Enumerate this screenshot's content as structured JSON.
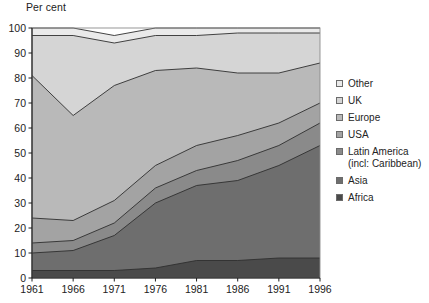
{
  "chart_data": {
    "type": "area",
    "stacked": true,
    "title": "",
    "subtitle": "",
    "ylabel": "Per cent",
    "xlabel": "",
    "ylim": [
      0,
      100
    ],
    "yticks": [
      0,
      10,
      20,
      30,
      40,
      50,
      60,
      70,
      80,
      90,
      100
    ],
    "grid": false,
    "legend_position": "right",
    "x": [
      1961,
      1966,
      1971,
      1976,
      1981,
      1986,
      1991,
      1996
    ],
    "categories": [
      "1961",
      "1966",
      "1971",
      "1976",
      "1981",
      "1986",
      "1991",
      "1996"
    ],
    "series": [
      {
        "name": "Africa",
        "color": "#4a4a4a",
        "values": [
          3,
          3,
          3,
          4,
          7,
          7,
          8,
          8
        ]
      },
      {
        "name": "Asia",
        "color": "#6e6e6e",
        "values": [
          7,
          8,
          14,
          26,
          30,
          32,
          37,
          45
        ]
      },
      {
        "name": "Latin America (incl: Caribbean)",
        "color": "#8a8a8a",
        "values": [
          4,
          4,
          5,
          6,
          6,
          8,
          8,
          9
        ]
      },
      {
        "name": "USA",
        "color": "#a3a3a3",
        "values": [
          10,
          8,
          9,
          9,
          10,
          10,
          9,
          8
        ]
      },
      {
        "name": "Europe",
        "color": "#b9b9b9",
        "values": [
          57,
          42,
          46,
          38,
          31,
          25,
          20,
          16
        ]
      },
      {
        "name": "UK",
        "color": "#d5d5d5",
        "values": [
          16,
          32,
          17,
          14,
          13,
          16,
          16,
          12
        ]
      },
      {
        "name": "Other",
        "color": "#eaeaea",
        "values": [
          3,
          3,
          3,
          3,
          3,
          2,
          2,
          2
        ]
      }
    ],
    "cumulative_top_boundaries": {
      "Africa": [
        3,
        3,
        3,
        4,
        7,
        7,
        8,
        8
      ],
      "Asia": [
        10,
        11,
        17,
        30,
        37,
        39,
        45,
        53
      ],
      "LatinAmerica": [
        14,
        15,
        22,
        36,
        43,
        47,
        53,
        62
      ],
      "USA": [
        24,
        23,
        31,
        45,
        53,
        57,
        62,
        70
      ],
      "Europe": [
        81,
        65,
        77,
        83,
        84,
        82,
        82,
        86
      ],
      "UK": [
        97,
        97,
        94,
        97,
        97,
        98,
        98,
        98
      ],
      "Other": [
        100,
        100,
        100,
        100,
        100,
        100,
        100,
        100
      ]
    }
  },
  "axis": {
    "y_title": "Per cent",
    "y_tick_labels": [
      "100",
      "90",
      "80",
      "70",
      "60",
      "50",
      "40",
      "30",
      "20",
      "10",
      "0"
    ],
    "x_tick_labels": [
      "1961",
      "1966",
      "1971",
      "1976",
      "1981",
      "1986",
      "1991",
      "1996"
    ]
  },
  "legend": {
    "items": [
      {
        "label": "Other",
        "color": "#eaeaea"
      },
      {
        "label": "UK",
        "color": "#d5d5d5"
      },
      {
        "label": "Europe",
        "color": "#b9b9b9"
      },
      {
        "label": "USA",
        "color": "#a3a3a3"
      },
      {
        "label": "Latin America\n(incl: Caribbean)",
        "color": "#8a8a8a"
      },
      {
        "label": "Asia",
        "color": "#6e6e6e"
      },
      {
        "label": "Africa",
        "color": "#4a4a4a"
      }
    ]
  }
}
